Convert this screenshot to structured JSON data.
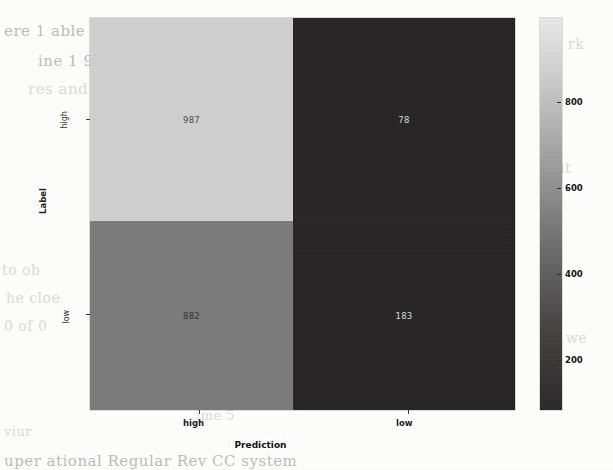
{
  "figure": {
    "xlabel": "Prediction",
    "ylabel": "Label",
    "xticks": [
      "high",
      "low"
    ],
    "yticks": [
      "high",
      "low"
    ]
  },
  "colorbar": {
    "ticks": [
      "800",
      "600",
      "400",
      "200"
    ],
    "low_color": "#231f20",
    "high_color": "#e8e8e8"
  },
  "chart_data": {
    "type": "heatmap",
    "title": "",
    "xlabel": "Prediction",
    "ylabel": "Label",
    "x_categories": [
      "high",
      "low"
    ],
    "y_categories": [
      "high",
      "low"
    ],
    "values": [
      [
        987,
        78
      ],
      [
        882,
        183
      ]
    ],
    "cell_labels": [
      [
        "987",
        "78"
      ],
      [
        "882",
        "183"
      ]
    ],
    "cell_colors": [
      [
        "#d2d2d2",
        "#262324"
      ],
      [
        "#7b7b7b",
        "#262324"
      ]
    ],
    "cell_text_colors": [
      [
        "#4a4a4a",
        "#d9d9d9"
      ],
      [
        "#3a3a3a",
        "#d9d9d9"
      ]
    ],
    "colorbar_ticks": [
      200,
      400,
      600,
      800
    ],
    "colormap": "gray",
    "vmin": 78,
    "vmax": 987,
    "grid": false,
    "legend": "colorbar-right"
  },
  "background_text": {
    "lines": [
      {
        "text": "ere 1 able",
        "x": 4,
        "y": 22,
        "size": 15,
        "class": "strong"
      },
      {
        "text": "ine 1 9(",
        "x": 38,
        "y": 52,
        "size": 15,
        "class": "strong"
      },
      {
        "text": "res  and",
        "x": 28,
        "y": 80,
        "size": 15,
        "class": "faint"
      },
      {
        "text": "nnels  were  the  label",
        "x": 196,
        "y": 20,
        "size": 14,
        "class": "strong"
      },
      {
        "text": "with  a  p-value  of  p-lt",
        "x": 230,
        "y": 48,
        "size": 14,
        "class": "strong"
      },
      {
        "text": "nd  one  of  the  most",
        "x": 242,
        "y": 76,
        "size": 14,
        "class": "strong"
      },
      {
        "text": "signif",
        "x": 300,
        "y": 104,
        "size": 14,
        "class": "strong"
      },
      {
        "text": "to  ob",
        "x": 2,
        "y": 262,
        "size": 14,
        "class": "faint"
      },
      {
        "text": "he  cloe",
        "x": 6,
        "y": 290,
        "size": 14,
        "class": "faint"
      },
      {
        "text": "0  of  0",
        "x": 4,
        "y": 318,
        "size": 14,
        "class": "faint"
      },
      {
        "text": "val  in  the  va",
        "x": 196,
        "y": 262,
        "size": 14,
        "class": "faint"
      },
      {
        "text": "rig  the  colon",
        "x": 242,
        "y": 290,
        "size": 14,
        "class": "faint"
      },
      {
        "text": "ut  0.0",
        "x": 330,
        "y": 318,
        "size": 14,
        "class": "faint"
      },
      {
        "text": "ime  5",
        "x": 196,
        "y": 408,
        "size": 13,
        "class": "faint"
      },
      {
        "text": "uper  ational  Regular  Rev  CC  system",
        "x": 4,
        "y": 452,
        "size": 15,
        "class": "strong"
      },
      {
        "text": "viur",
        "x": 4,
        "y": 424,
        "size": 13,
        "class": "faint"
      },
      {
        "text": "it",
        "x": 560,
        "y": 160,
        "size": 14,
        "class": "faint"
      },
      {
        "text": "rk",
        "x": 568,
        "y": 36,
        "size": 14,
        "class": "faint"
      },
      {
        "text": "we",
        "x": 566,
        "y": 330,
        "size": 14,
        "class": "faint"
      }
    ]
  }
}
